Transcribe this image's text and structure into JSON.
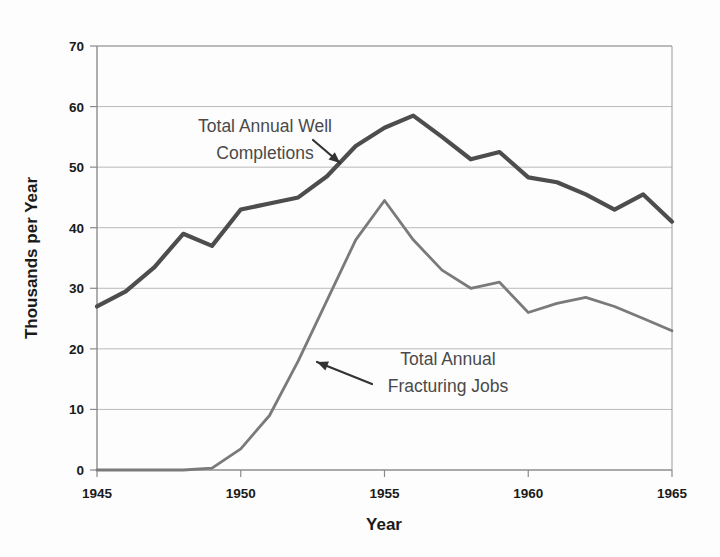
{
  "chart_data": {
    "type": "line",
    "title": "",
    "xlabel": "Year",
    "ylabel": "Thousands per Year",
    "xlim": [
      1945,
      1965
    ],
    "ylim": [
      0,
      70
    ],
    "grid": true,
    "legend_position": "annotations-inline",
    "xticks": [
      "1945",
      "1950",
      "1955",
      "1960",
      "1965"
    ],
    "xtick_values": [
      1945,
      1950,
      1955,
      1960,
      1965
    ],
    "yticks": [
      "0",
      "10",
      "20",
      "30",
      "40",
      "50",
      "60",
      "70"
    ],
    "ytick_values": [
      0,
      10,
      20,
      30,
      40,
      50,
      60,
      70
    ],
    "x": [
      1945,
      1946,
      1947,
      1948,
      1949,
      1950,
      1951,
      1952,
      1953,
      1954,
      1955,
      1956,
      1957,
      1958,
      1959,
      1960,
      1961,
      1962,
      1963,
      1964,
      1965
    ],
    "series": [
      {
        "name": "Total Annual Well Completions",
        "color": "#4d4d4d",
        "width": 4.2,
        "values": [
          27.0,
          29.5,
          33.5,
          39.0,
          37.0,
          43.0,
          44.0,
          45.0,
          48.5,
          53.5,
          56.5,
          58.5,
          55.0,
          51.3,
          52.5,
          48.3,
          47.5,
          45.5,
          43.0,
          45.5,
          41.0
        ]
      },
      {
        "name": "Total Annual Fracturing Jobs",
        "color": "#7a7a7a",
        "width": 2.8,
        "values": [
          0.0,
          0.0,
          0.0,
          0.0,
          0.3,
          3.5,
          9.0,
          18.0,
          28.0,
          38.0,
          44.5,
          38.0,
          33.0,
          30.0,
          31.0,
          26.0,
          27.5,
          28.5,
          27.0,
          25.0,
          23.0
        ]
      }
    ],
    "annotations": [
      {
        "id": "well-completions-annotation",
        "line1": "Total Annual Well",
        "line2": "Completions",
        "text_x": 265,
        "text_y": 132,
        "anchor": "middle",
        "arrow_from": [
          313,
          140
        ],
        "arrow_to": [
          340,
          163
        ]
      },
      {
        "id": "fracturing-jobs-annotation",
        "line1": "Total Annual",
        "line2": "Fracturing Jobs",
        "text_x": 448,
        "text_y": 365,
        "anchor": "middle",
        "arrow_from": [
          372,
          384
        ],
        "arrow_to": [
          317,
          362
        ]
      }
    ]
  },
  "plot_geometry": {
    "left": 97,
    "right": 672,
    "top": 46,
    "bottom": 470
  }
}
